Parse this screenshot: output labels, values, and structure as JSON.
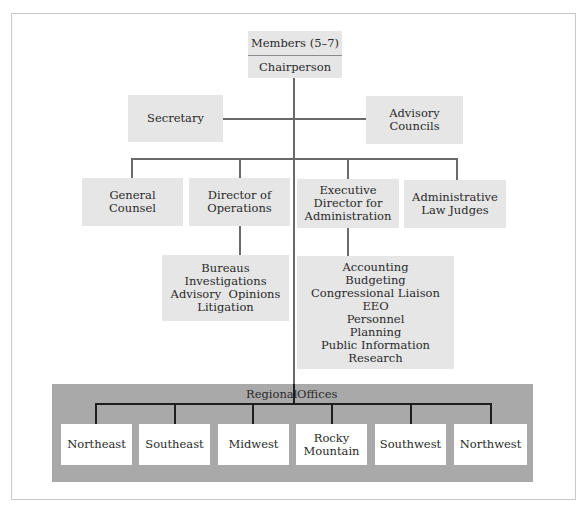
{
  "top": {
    "members": "Members (5–7)",
    "chair": "Chairperson"
  },
  "staff": {
    "secretary": "Secretary",
    "advisory": [
      "Advisory",
      "Councils"
    ]
  },
  "units": [
    {
      "lines": [
        "General",
        "Counsel"
      ]
    },
    {
      "lines": [
        "Director of",
        "Operations"
      ]
    },
    {
      "lines": [
        "Executive",
        "Director for",
        "Administration"
      ]
    },
    {
      "lines": [
        "Administrative",
        "Law Judges"
      ]
    }
  ],
  "operations_sub": [
    "Bureaus",
    "Investigations",
    "Advisory  Opinions",
    "Litigation"
  ],
  "administration_sub": [
    "Accounting",
    "Budgeting",
    "Congressional Liaison",
    "EEO",
    "Personnel",
    "Planning",
    "Public Information",
    "Research"
  ],
  "regional": {
    "title_left": "Regional",
    "title_right": "Offices",
    "offices": [
      {
        "lines": [
          "Northeast"
        ]
      },
      {
        "lines": [
          "Southeast"
        ]
      },
      {
        "lines": [
          "Midwest"
        ]
      },
      {
        "lines": [
          "Rocky",
          "Mountain"
        ]
      },
      {
        "lines": [
          "Southwest"
        ]
      },
      {
        "lines": [
          "Northwest"
        ]
      }
    ]
  },
  "colors": {
    "box_fill": "#e6e6e6",
    "region_fill": "#a9a9a9",
    "line": "#6a6a6a"
  }
}
